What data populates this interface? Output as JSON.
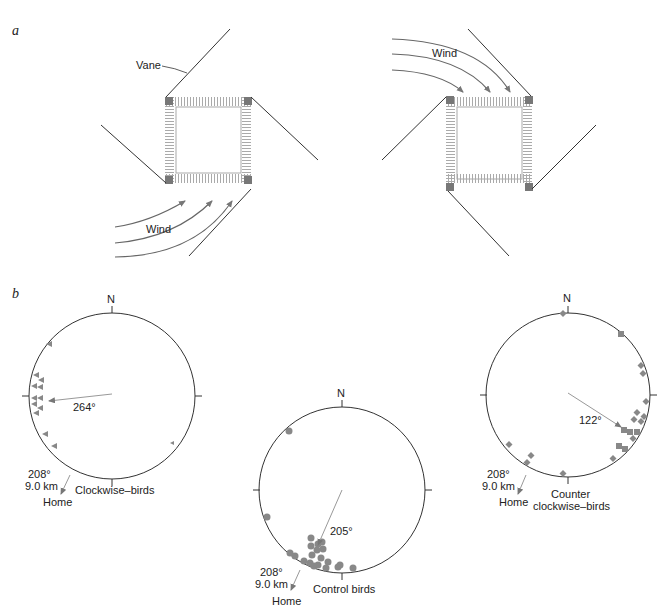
{
  "panel_a": {
    "label": "a",
    "left": {
      "vane_label": "Vane",
      "wind_label": "Wind",
      "rotation": "clockwise"
    },
    "right": {
      "wind_label": "Wind",
      "rotation": "counterclockwise"
    }
  },
  "panel_b": {
    "label": "b",
    "circles": [
      {
        "name": "Clockwise-birds",
        "north": "N",
        "mean_label": "264°",
        "mean_deg": 264,
        "home_deg_label": "208°",
        "home_dist_label": "9.0 km",
        "home_label": "Home",
        "caption": "Clockwise–birds",
        "symbol": "triangle"
      },
      {
        "name": "Control birds",
        "north": "N",
        "mean_label": "205°",
        "mean_deg": 205,
        "home_deg_label": "208°",
        "home_dist_label": "9.0 km",
        "home_label": "Home",
        "caption": "Control birds",
        "symbol": "circle"
      },
      {
        "name": "Counter clockwise-birds",
        "north": "N",
        "mean_label": "122°",
        "mean_deg": 122,
        "home_deg_label": "208°",
        "home_dist_label": "9.0 km",
        "home_label": "Home",
        "caption_line1": "Counter",
        "caption_line2": "clockwise–birds",
        "symbol": "diamond"
      }
    ]
  },
  "colors": {
    "line": "#333333",
    "symbol": "#888888",
    "arrow": "#999999",
    "hatch": "#aaaaaa"
  }
}
